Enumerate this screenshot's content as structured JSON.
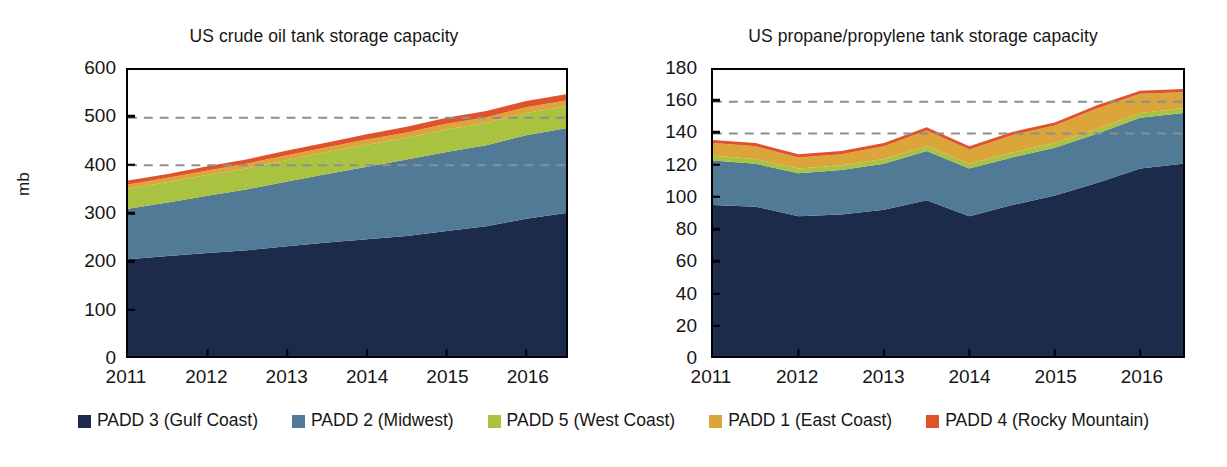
{
  "figure": {
    "series_names": [
      "PADD 3 (Gulf Coast)",
      "PADD 2 (Midwest)",
      "PADD 5 (West Coast)",
      "PADD 1 (East Coast)",
      "PADD 4 (Rocky Mountain)"
    ],
    "series_colors": [
      "#1b2b49",
      "#507a96",
      "#a9c23f",
      "#dba53a",
      "#e0522c"
    ]
  },
  "legend": {
    "position": "bottom-center",
    "items": [
      {
        "label": "PADD 3 (Gulf Coast)",
        "color": "#1b2b49"
      },
      {
        "label": "PADD 2 (Midwest)",
        "color": "#507a96"
      },
      {
        "label": "PADD 5 (West Coast)",
        "color": "#a9c23f"
      },
      {
        "label": "PADD 1 (East Coast)",
        "color": "#dba53a"
      },
      {
        "label": "PADD 4 (Rocky Mountain)",
        "color": "#e0522c"
      }
    ]
  },
  "left": {
    "title": "US crude oil tank storage capacity",
    "ylabel": "mb",
    "yticks": [
      "0",
      "100",
      "200",
      "300",
      "400",
      "500",
      "600"
    ],
    "xticks": [
      "2011",
      "2012",
      "2013",
      "2014",
      "2015",
      "2016"
    ]
  },
  "right": {
    "title": "US propane/propylene tank storage capacity",
    "ylabel": "",
    "yticks": [
      "0",
      "20",
      "40",
      "60",
      "80",
      "100",
      "120",
      "140",
      "160",
      "180"
    ],
    "xticks": [
      "2011",
      "2012",
      "2013",
      "2014",
      "2015",
      "2016"
    ]
  },
  "chart_data": [
    {
      "type": "area",
      "stacked": true,
      "title": "US crude oil tank storage capacity",
      "xlabel": "",
      "ylabel": "mb",
      "ylim": [
        0,
        600
      ],
      "yticks": [
        0,
        100,
        200,
        300,
        400,
        500,
        600
      ],
      "grid": "dashed horizontal gridlines at 400 and 500",
      "gridlines": [
        400,
        500
      ],
      "x": [
        "2011H1",
        "2011H2",
        "2012H1",
        "2012H2",
        "2013H1",
        "2013H2",
        "2014H1",
        "2014H2",
        "2015H1",
        "2015H2",
        "2016H1",
        "2016H2"
      ],
      "xtick_labels": [
        "2011",
        "2012",
        "2013",
        "2014",
        "2015",
        "2016"
      ],
      "series": [
        {
          "name": "PADD 3 (Gulf Coast)",
          "color": "#1b2b49",
          "values": [
            203,
            210,
            216,
            222,
            230,
            238,
            245,
            252,
            262,
            272,
            288,
            300
          ]
        },
        {
          "name": "PADD 2 (Midwest)",
          "color": "#507a96",
          "values": [
            106,
            112,
            120,
            128,
            136,
            144,
            152,
            160,
            166,
            170,
            175,
            178
          ]
        },
        {
          "name": "PADD 5 (West Coast)",
          "color": "#a9c23f",
          "values": [
            42,
            43,
            44,
            44,
            45,
            46,
            46,
            46,
            47,
            47,
            47,
            46
          ]
        },
        {
          "name": "PADD 1 (East Coast)",
          "color": "#dba53a",
          "values": [
            9,
            9,
            9,
            10,
            10,
            10,
            11,
            11,
            12,
            12,
            12,
            12
          ]
        },
        {
          "name": "PADD 4 (Rocky Mountain)",
          "color": "#e0522c",
          "values": [
            8,
            8,
            9,
            9,
            10,
            10,
            11,
            12,
            13,
            13,
            13,
            13
          ]
        }
      ],
      "totals": [
        368,
        382,
        398,
        413,
        431,
        448,
        465,
        481,
        500,
        514,
        535,
        549
      ]
    },
    {
      "type": "area",
      "stacked": true,
      "title": "US propane/propylene tank storage capacity",
      "xlabel": "",
      "ylabel": "",
      "ylim": [
        0,
        180
      ],
      "yticks": [
        0,
        20,
        40,
        60,
        80,
        100,
        120,
        140,
        160,
        180
      ],
      "grid": "dashed horizontal gridlines at 140 and 160",
      "gridlines": [
        140,
        160
      ],
      "x": [
        "2011H1",
        "2011H2",
        "2012H1",
        "2012H2",
        "2013H1",
        "2013H2",
        "2014H1",
        "2014H2",
        "2015H1",
        "2015H2",
        "2016H1",
        "2016H2"
      ],
      "xtick_labels": [
        "2011",
        "2012",
        "2013",
        "2014",
        "2015",
        "2016"
      ],
      "series": [
        {
          "name": "PADD 3 (Gulf Coast)",
          "color": "#1b2b49",
          "values": [
            95,
            94,
            88,
            89,
            92,
            98,
            88,
            95,
            101,
            109,
            118,
            121
          ]
        },
        {
          "name": "PADD 2 (Midwest)",
          "color": "#507a96",
          "values": [
            28,
            27,
            27,
            28,
            29,
            31,
            30,
            30,
            30,
            31,
            32,
            32
          ]
        },
        {
          "name": "PADD 5 (West Coast)",
          "color": "#a9c23f",
          "values": [
            3,
            3,
            3,
            3,
            3,
            3,
            3,
            3,
            3,
            3,
            3,
            3
          ]
        },
        {
          "name": "PADD 1 (East Coast)",
          "color": "#dba53a",
          "values": [
            8,
            8,
            7,
            7,
            8,
            10,
            9,
            11,
            11,
            13,
            12,
            10
          ]
        },
        {
          "name": "PADD 4 (Rocky Mountain)",
          "color": "#e0522c",
          "values": [
            2,
            2,
            2,
            2,
            2,
            2,
            2,
            2,
            2,
            2,
            2,
            2
          ]
        }
      ],
      "totals": [
        136,
        134,
        127,
        129,
        134,
        144,
        132,
        141,
        147,
        158,
        167,
        168
      ]
    }
  ]
}
